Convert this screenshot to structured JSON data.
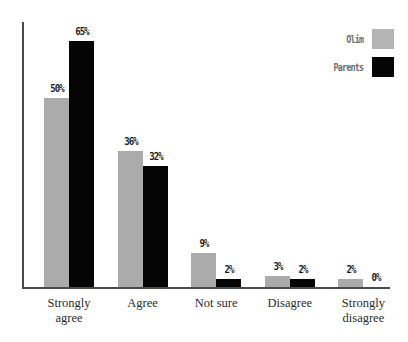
{
  "chart_data": {
    "type": "bar",
    "title": "",
    "subtitle": "",
    "xlabel": "",
    "ylabel": "",
    "ylim": [
      0,
      70
    ],
    "grid": false,
    "legend_position": "top-right",
    "value_label_suffix": "%",
    "categories": [
      "Strongly agree",
      "Agree",
      "Not sure",
      "Disagree",
      "Strongly disagree"
    ],
    "series": [
      {
        "name": "Olim",
        "color": "#ababab",
        "values": [
          50,
          36,
          9,
          3,
          2
        ],
        "value_labels": [
          "50%",
          "36%",
          "9%",
          "3%",
          "2%"
        ]
      },
      {
        "name": "Parents",
        "color": "#050505",
        "values": [
          65,
          32,
          2,
          2,
          0
        ],
        "value_labels": [
          "65%",
          "32%",
          "2%",
          "2%",
          "0%"
        ]
      }
    ]
  },
  "legend": {
    "entries": [
      {
        "label": "Olim"
      },
      {
        "label": "Parents"
      }
    ]
  },
  "axis": {
    "categories": [
      {
        "line1": "Strongly",
        "line2": "agree"
      },
      {
        "line1": "Agree",
        "line2": ""
      },
      {
        "line1": "Not sure",
        "line2": ""
      },
      {
        "line1": "Disagree",
        "line2": ""
      },
      {
        "line1": "Strongly",
        "line2": "disagree"
      }
    ]
  }
}
